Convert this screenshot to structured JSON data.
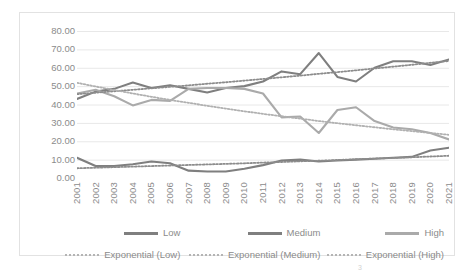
{
  "chart_data": {
    "type": "line",
    "title": "",
    "xlabel": "",
    "ylabel": "",
    "ylim": [
      0,
      80
    ],
    "ytick_step": 10,
    "grid": true,
    "legend_position": "bottom",
    "ytick_labels": [
      "80.00",
      "70.00",
      "60.00",
      "50.00",
      "40.00",
      "30.00",
      "20.00",
      "10.00",
      "0.00"
    ],
    "ytick_values": [
      80,
      70,
      60,
      50,
      40,
      30,
      20,
      10,
      0
    ],
    "categories": [
      "2001",
      "2002",
      "2003",
      "2004",
      "2005",
      "2006",
      "2007",
      "2008",
      "2009",
      "2010",
      "2011",
      "2012",
      "2013",
      "2014",
      "2015",
      "2016",
      "2017",
      "2018",
      "2019",
      "2020",
      "2021"
    ],
    "x": [
      2001,
      2002,
      2003,
      2004,
      2005,
      2006,
      2007,
      2008,
      2009,
      2010,
      2011,
      2012,
      2013,
      2014,
      2015,
      2016,
      2017,
      2018,
      2019,
      2020,
      2021
    ],
    "series": [
      {
        "name": "Low",
        "style": "solid",
        "color": "#7f7f7f",
        "values": [
          11.0,
          6.5,
          6.5,
          7.5,
          9.0,
          8.0,
          4.0,
          3.5,
          3.5,
          5.0,
          7.0,
          9.5,
          10.0,
          9.0,
          9.5,
          10.0,
          10.5,
          11.0,
          11.5,
          15.0,
          16.5
        ]
      },
      {
        "name": "Medium",
        "style": "solid",
        "color": "#7f7f7f",
        "values": [
          43.0,
          47.0,
          48.5,
          52.0,
          49.0,
          50.5,
          48.5,
          46.5,
          49.0,
          50.0,
          52.5,
          58.0,
          56.5,
          68.0,
          55.0,
          52.5,
          60.0,
          63.5,
          63.5,
          61.5,
          64.5
        ]
      },
      {
        "name": "High",
        "style": "solid",
        "color": "#aaaaaa",
        "values": [
          46.0,
          48.0,
          44.5,
          39.5,
          42.5,
          42.0,
          48.5,
          49.0,
          49.0,
          48.5,
          46.0,
          33.0,
          33.5,
          24.5,
          37.0,
          38.5,
          31.0,
          27.5,
          26.5,
          24.5,
          21.0
        ]
      },
      {
        "name": "Exponential (Low)",
        "style": "dotted",
        "color": "#8c8c8c",
        "values": [
          5.3,
          5.6,
          5.9,
          6.2,
          6.5,
          6.8,
          7.1,
          7.4,
          7.7,
          8.0,
          8.4,
          8.7,
          9.1,
          9.4,
          9.8,
          10.2,
          10.6,
          10.9,
          11.3,
          11.7,
          12.1
        ]
      },
      {
        "name": "Exponential (Medium)",
        "style": "dotted",
        "color": "#8c8c8c",
        "values": [
          45.6,
          46.4,
          47.2,
          48.0,
          48.8,
          49.6,
          50.4,
          51.3,
          52.1,
          53.0,
          53.9,
          54.8,
          55.7,
          56.7,
          57.6,
          58.6,
          59.6,
          60.6,
          61.6,
          62.7,
          63.7
        ]
      },
      {
        "name": "Exponential (High)",
        "style": "dotted",
        "color": "#b0b0b0",
        "values": [
          51.8,
          49.8,
          47.9,
          46.0,
          44.2,
          42.5,
          40.9,
          39.3,
          37.8,
          36.3,
          34.9,
          33.6,
          32.3,
          31.0,
          29.8,
          28.7,
          27.6,
          26.5,
          25.5,
          24.5,
          23.5
        ]
      }
    ]
  },
  "legend": {
    "row1": [
      {
        "label": "Low",
        "style": "solid",
        "color": "#7f7f7f"
      },
      {
        "label": "Medium",
        "style": "solid",
        "color": "#7f7f7f"
      },
      {
        "label": "High",
        "style": "solid",
        "color": "#aaaaaa"
      }
    ],
    "row2": [
      {
        "label": "Exponential (Low)",
        "style": "dotted",
        "color": "#b4b4b4"
      },
      {
        "label": "Exponential (Medium)",
        "style": "dotted",
        "color": "#b4b4b4"
      },
      {
        "label": "Exponential (High)",
        "style": "dotted",
        "color": "#b4b4b4"
      }
    ]
  },
  "page_artifact": "3",
  "colors": {
    "gridline": "#e8e8e8",
    "axis_text": "#8b8b8b",
    "frame_border": "#e2e2e2",
    "background": "#ffffff"
  }
}
